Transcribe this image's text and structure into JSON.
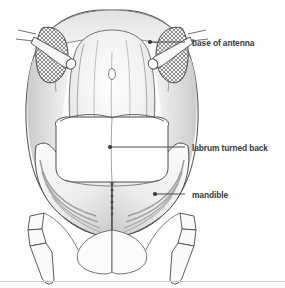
{
  "figure": {
    "kind": "anatomical-illustration",
    "background_color": "#fefefe",
    "ink_color": "#4a4a4a",
    "label_color": "#3a3a3a",
    "border_color": "#cccccc",
    "width": 285,
    "height": 288
  },
  "labels": [
    {
      "id": "base-of-antenna",
      "text": "base of antenna",
      "text_x": 192,
      "text_y": 38.5,
      "leader_x1": 185,
      "leader_y1": 42,
      "leader_x2": 150,
      "leader_y2": 42,
      "target_x": 150,
      "target_y": 42
    },
    {
      "id": "labrum-turned-back",
      "text": "labrum turned back",
      "text_x": 192,
      "text_y": 143.5,
      "leader_x1": 185,
      "leader_y1": 147,
      "leader_x2": 110,
      "leader_y2": 147,
      "target_x": 110,
      "target_y": 147
    },
    {
      "id": "mandible",
      "text": "mandible",
      "text_x": 192,
      "text_y": 190.5,
      "leader_x1": 185,
      "leader_y1": 194,
      "leader_x2": 155,
      "leader_y2": 194,
      "target_x": 155,
      "target_y": 194
    }
  ],
  "anatomy": {
    "head_capsule": "outer oval head capsule outline",
    "vertex": "top arc of head",
    "frons": "central shaded plate with median ridge and small pale ocellus oval",
    "genae": "lateral shaded cheek regions",
    "antennal_sockets": "two crosshatched patches flanking the frons",
    "antenna_stubs": "two short truncated antenna bases projecting outward",
    "labrum": "white rounded plate folded back over the centre, split by a median seam",
    "mandibles": "two large curved jaws with concentric striations meeting at a toothed midline",
    "palps": "two segmented appendages descending from each lower corner"
  }
}
